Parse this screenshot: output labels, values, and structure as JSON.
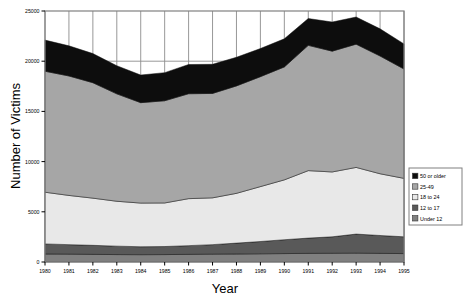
{
  "chart_data": {
    "type": "area",
    "stacked": true,
    "title": "",
    "xlabel": "Year",
    "ylabel": "Number of Victims",
    "categories": [
      1980,
      1981,
      1982,
      1983,
      1984,
      1985,
      1986,
      1987,
      1988,
      1989,
      1990,
      1991,
      1992,
      1993,
      1994,
      1995
    ],
    "x": [
      "1980",
      "1981",
      "1982",
      "1983",
      "1984",
      "1985",
      "1986",
      "1987",
      "1988",
      "1989",
      "1990",
      "1991",
      "1992",
      "1993",
      "1994",
      "1995"
    ],
    "xlim": [
      1980,
      1995
    ],
    "ylim": [
      0,
      25000
    ],
    "yticks": [
      0,
      5000,
      10000,
      15000,
      20000,
      25000
    ],
    "ytick_labels": [
      "0",
      "5000",
      "10000",
      "15000",
      "20000",
      "25000"
    ],
    "xticks": [
      "1980",
      "1981",
      "1982",
      "1983",
      "1984",
      "1985",
      "1986",
      "1987",
      "1988",
      "1989",
      "1990",
      "1991",
      "1992",
      "1993",
      "1994",
      "1995"
    ],
    "grid": true,
    "grid_note": "vertical gridlines at each year plus horizontal line at 20000, visible only above the stacked area",
    "legend_position": "right-middle",
    "series": [
      {
        "name": "Under 12",
        "color": "#808080",
        "values": [
          800,
          780,
          760,
          740,
          730,
          740,
          760,
          780,
          800,
          820,
          840,
          860,
          870,
          880,
          860,
          840
        ]
      },
      {
        "name": "12 to 17",
        "color": "#595959",
        "values": [
          1000,
          950,
          900,
          840,
          790,
          800,
          870,
          950,
          1080,
          1220,
          1380,
          1520,
          1640,
          1900,
          1780,
          1670
        ]
      },
      {
        "name": "18 to 24",
        "color": "#E8E8E8",
        "values": [
          5150,
          4900,
          4700,
          4470,
          4350,
          4340,
          4680,
          4660,
          4960,
          5470,
          5960,
          6720,
          6460,
          6640,
          6150,
          5820
        ]
      },
      {
        "name": "25-49",
        "color": "#A6A6A6",
        "values": [
          12050,
          11900,
          11500,
          10700,
          10000,
          10180,
          10450,
          10400,
          10700,
          10950,
          11250,
          12480,
          12030,
          12280,
          11730,
          10890
        ]
      },
      {
        "name": "50 or older",
        "color": "#0D0D0D",
        "values": [
          3100,
          3000,
          2900,
          2800,
          2750,
          2800,
          2910,
          2900,
          2850,
          2800,
          2800,
          2670,
          2900,
          2700,
          2700,
          2500
        ]
      }
    ],
    "totals": [
      22100,
      21530,
      20760,
      19550,
      18620,
      18860,
      19670,
      19690,
      20390,
      21260,
      22230,
      24250,
      23900,
      24400,
      23220,
      21720
    ]
  },
  "legend": {
    "items": [
      {
        "label": "50 or older",
        "color": "#0D0D0D"
      },
      {
        "label": "25-49",
        "color": "#A6A6A6"
      },
      {
        "label": "18 to 24",
        "color": "#E8E8E8"
      },
      {
        "label": "12 to 17",
        "color": "#595959"
      },
      {
        "label": "Under 12",
        "color": "#808080"
      }
    ]
  },
  "axes": {
    "y_title": "Number of Victims",
    "x_title": "Year"
  },
  "colors": {
    "plot_border": "#808080",
    "gridline": "#8C8C8C",
    "background": "#FFFFFF",
    "text": "#000000"
  }
}
